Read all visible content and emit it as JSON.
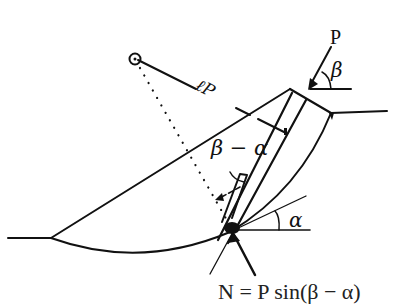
{
  "figure": {
    "type": "slope-stability-anchor-force-diagram",
    "labels": {
      "force": "P",
      "force_angle": "β",
      "lever_arm": "ℓP",
      "relative_angle": "β − α",
      "slip_angle": "α",
      "formula_partial": "N = P sin(β − α)"
    },
    "colors": {
      "ink": "#111111",
      "background": "#ffffff"
    },
    "elements": [
      "rotation-center-circle",
      "slope-surface-line",
      "circular-slip-surface",
      "anchor-force-arrow",
      "lever-arm-line",
      "dotted-radius-line",
      "tangent-line-at-base",
      "normal-force-arrow"
    ]
  }
}
